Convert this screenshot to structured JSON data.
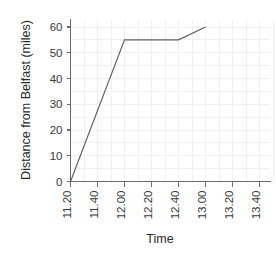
{
  "chart_data": {
    "type": "line",
    "title": "",
    "xlabel": "Time",
    "ylabel": "Distance from Belfast (miles)",
    "xtick_labels": [
      "11.20",
      "11.40",
      "12.00",
      "12.20",
      "12.40",
      "13.00",
      "13.20",
      "13.40"
    ],
    "ytick_labels": [
      "0",
      "10",
      "20",
      "30",
      "40",
      "50",
      "60"
    ],
    "ytick_values": [
      0,
      10,
      20,
      30,
      40,
      50,
      60
    ],
    "ylim": [
      0,
      65
    ],
    "xlim": [
      0,
      8
    ],
    "grid": true,
    "legend": "none",
    "series": [
      {
        "name": "journey",
        "points": [
          {
            "x": "11.20",
            "y": 0
          },
          {
            "x": "12.00",
            "y": 55
          },
          {
            "x": "12.40",
            "y": 55
          },
          {
            "x": "13.00",
            "y": 60
          }
        ]
      }
    ],
    "colors": {
      "line": "#5f5f5f",
      "axis": "#6b6b6b",
      "grid": "#ececf2",
      "text": "#2b2b2b",
      "background": "#ffffff"
    }
  }
}
